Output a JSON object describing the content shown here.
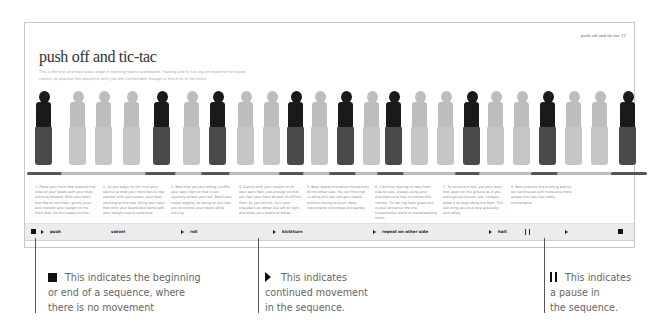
{
  "page": {
    "running_head": "push off and tic-tac   21",
    "title": "push off and tic-tac",
    "intro": "This is the first and most basic stage in learning how to skateboard. Pushing and tic-tac-ing are essential for board control, so practise this sequence until you feel comfortable enough to move on to the tricks."
  },
  "figures": [
    {
      "x": 0,
      "tone": "dark"
    },
    {
      "x": 34,
      "tone": "light"
    },
    {
      "x": 60,
      "tone": "light"
    },
    {
      "x": 88,
      "tone": "light"
    },
    {
      "x": 118,
      "tone": "dark"
    },
    {
      "x": 148,
      "tone": "light"
    },
    {
      "x": 174,
      "tone": "dark"
    },
    {
      "x": 202,
      "tone": "light"
    },
    {
      "x": 228,
      "tone": "light"
    },
    {
      "x": 252,
      "tone": "dark"
    },
    {
      "x": 276,
      "tone": "light"
    },
    {
      "x": 302,
      "tone": "dark"
    },
    {
      "x": 328,
      "tone": "light"
    },
    {
      "x": 350,
      "tone": "dark"
    },
    {
      "x": 376,
      "tone": "light"
    },
    {
      "x": 402,
      "tone": "light"
    },
    {
      "x": 428,
      "tone": "dark"
    },
    {
      "x": 452,
      "tone": "light"
    },
    {
      "x": 478,
      "tone": "light"
    },
    {
      "x": 504,
      "tone": "dark"
    },
    {
      "x": 530,
      "tone": "light"
    },
    {
      "x": 556,
      "tone": "light"
    },
    {
      "x": 584,
      "tone": "dark"
    }
  ],
  "captions": [
    {
      "x": 0,
      "text": "1. Place your front foot towards the nose of your board with your toes pointing forward. With your back foot flat on the floor, gently push and transfer your weight to the front foot. Do this slowly at first."
    },
    {
      "x": 68,
      "text": "2. As you begin to roll, turn your stance so that your front foot is now parallel with your board, your toes pointing to the side. Bring your back foot onto your board and stand with your weight evenly balanced."
    },
    {
      "x": 136,
      "text": "3. Now that you are rolling, shuffle your back foot so that it sits squarely across your tail. Bend your knees slightly, as doing so will help you to control your board while moving."
    },
    {
      "x": 204,
      "text": "4. Gently shift your weight on to your back foot, just enough so that you feel your front wheels lift off the floor. As you do this, turn your shoulders as rather like left or right and allow your board to follow."
    },
    {
      "x": 272,
      "text": "5. Now repeat the same movements to the other side. You will find that in doing this you will gain speed without having to push. Keep movements controlled and gentle."
    },
    {
      "x": 340,
      "text": "6. Continue making tic-tacs from side to side, always using your shoulders and hips to control the motion. Tic-tac-ing feels great and is your entrance into the fundamental world of skateboarding tricks."
    },
    {
      "x": 408,
      "text": "7. To come to a halt, put your back foot down on the ground as if you were going to push, but, instead, allow it to drag along the floor. This will bring you to a stop gradually and safely."
    },
    {
      "x": 476,
      "text": "8. Now practise the pushing and tic-tac techniques with more and more speed until you feel really comfortable."
    }
  ],
  "sequence_bar": {
    "items": [
      {
        "x": 6,
        "symbol": "stop",
        "label": ""
      },
      {
        "x": 16,
        "symbol": "play",
        "label": "push"
      },
      {
        "x": 86,
        "symbol": "none",
        "label": "swivel"
      },
      {
        "x": 156,
        "symbol": "play",
        "label": "roll"
      },
      {
        "x": 248,
        "symbol": "play",
        "label": "kicktturn"
      },
      {
        "x": 348,
        "symbol": "play",
        "label": "repeat on other side"
      },
      {
        "x": 464,
        "symbol": "play",
        "label": "halt"
      },
      {
        "x": 500,
        "symbol": "pause",
        "label": ""
      },
      {
        "x": 540,
        "symbol": "play",
        "label": ""
      },
      {
        "x": 593,
        "symbol": "stop",
        "label": ""
      }
    ]
  },
  "legend": {
    "stop": {
      "line1": "This indicates the beginning",
      "line2": "or end of a sequence, where",
      "line3": "there is no movement"
    },
    "play": {
      "line1": "This indicates",
      "line2": "continued movement",
      "line3": "in the sequence."
    },
    "pause": {
      "line1": "This indicates",
      "line2": "a pause in",
      "line3": "the sequence."
    }
  }
}
